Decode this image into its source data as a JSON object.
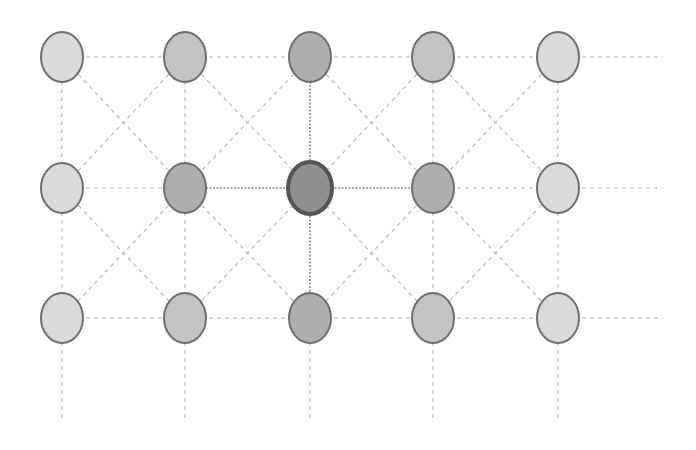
{
  "diagram": {
    "type": "grid-graph",
    "width": 696,
    "height": 450,
    "columns_x": [
      62,
      185,
      310,
      433,
      558
    ],
    "rows_y": [
      57,
      188,
      318
    ],
    "node_rx": 21,
    "node_ry": 25,
    "extend_right_to": 663,
    "extend_bottom_to": 420,
    "colors": {
      "background": "#ffffff",
      "edge": "#b4b4b4",
      "edge_strong": "#8c8c8c",
      "node_stroke": "#6e6e6e",
      "center_stroke": "#555555",
      "fill_light": "#dadada",
      "fill_medium": "#c3c3c3",
      "fill_dark": "#aeaeae",
      "fill_center": "#8f8f8f"
    },
    "nodes": [
      {
        "id": "r0c0",
        "row": 0,
        "col": 0,
        "shade": "light"
      },
      {
        "id": "r0c1",
        "row": 0,
        "col": 1,
        "shade": "medium"
      },
      {
        "id": "r0c2",
        "row": 0,
        "col": 2,
        "shade": "dark"
      },
      {
        "id": "r0c3",
        "row": 0,
        "col": 3,
        "shade": "medium"
      },
      {
        "id": "r0c4",
        "row": 0,
        "col": 4,
        "shade": "light"
      },
      {
        "id": "r1c0",
        "row": 1,
        "col": 0,
        "shade": "light"
      },
      {
        "id": "r1c1",
        "row": 1,
        "col": 1,
        "shade": "dark"
      },
      {
        "id": "r1c2",
        "row": 1,
        "col": 2,
        "shade": "center",
        "highlighted": true
      },
      {
        "id": "r1c3",
        "row": 1,
        "col": 3,
        "shade": "dark"
      },
      {
        "id": "r1c4",
        "row": 1,
        "col": 4,
        "shade": "light"
      },
      {
        "id": "r2c0",
        "row": 2,
        "col": 0,
        "shade": "light"
      },
      {
        "id": "r2c1",
        "row": 2,
        "col": 1,
        "shade": "medium"
      },
      {
        "id": "r2c2",
        "row": 2,
        "col": 2,
        "shade": "dark"
      },
      {
        "id": "r2c3",
        "row": 2,
        "col": 3,
        "shade": "medium"
      },
      {
        "id": "r2c4",
        "row": 2,
        "col": 4,
        "shade": "light"
      }
    ]
  }
}
